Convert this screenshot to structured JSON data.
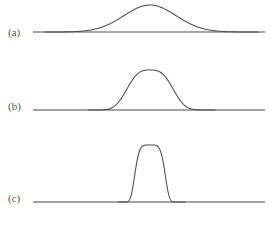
{
  "figure": {
    "title": "",
    "background_color": "#ffffff",
    "line_color": "#4a4d52",
    "label_color": "#55585c",
    "width": 270,
    "height": 226
  },
  "panels": [
    {
      "id": "a",
      "label": "(a)",
      "label_x": 8,
      "label_y": 26,
      "baseline": {
        "y": 32,
        "x_start": 33,
        "x_end": 265
      },
      "curve": {
        "type": "gaussian",
        "center_x": 150,
        "peak_y": 5,
        "amplitude": 27,
        "sigma": 26,
        "x_start": 45,
        "x_end": 258,
        "description": "broad low bell curve"
      }
    },
    {
      "id": "b",
      "label": "(b)",
      "label_x": 8,
      "label_y": 100,
      "baseline": {
        "y": 110,
        "x_start": 33,
        "x_end": 265
      },
      "curve": {
        "type": "super-gaussian",
        "center_x": 150,
        "peak_y": 70,
        "amplitude": 40,
        "sigma": 22,
        "exponent": 3,
        "x_start": 88,
        "x_end": 215,
        "description": "medium-width flat-topped bell curve"
      }
    },
    {
      "id": "c",
      "label": "(c)",
      "label_x": 8,
      "label_y": 192,
      "baseline": {
        "y": 202,
        "x_start": 33,
        "x_end": 265
      },
      "curve": {
        "type": "super-gaussian",
        "center_x": 150,
        "peak_y": 145,
        "amplitude": 57,
        "sigma": 13,
        "exponent": 5,
        "x_start": 118,
        "x_end": 185,
        "description": "narrow tall flat-topped peak"
      }
    }
  ],
  "chart_data": {
    "type": "line",
    "title": "",
    "xlabel": "",
    "ylabel": "",
    "grid": false,
    "legend": "none",
    "series": [
      {
        "name": "(a)",
        "shape": "gaussian",
        "center": 150,
        "width_sigma": 26,
        "height": 27,
        "baseline_y": 32
      },
      {
        "name": "(b)",
        "shape": "super-gaussian",
        "center": 150,
        "width_sigma": 22,
        "height": 40,
        "baseline_y": 110
      },
      {
        "name": "(c)",
        "shape": "super-gaussian",
        "center": 150,
        "width_sigma": 13,
        "height": 57,
        "baseline_y": 202
      }
    ]
  }
}
